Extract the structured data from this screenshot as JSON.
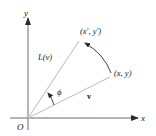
{
  "diagram": {
    "axes": {
      "x_label": "x",
      "y_label": "y",
      "origin_label": "O"
    },
    "vectors": {
      "original": {
        "label": "v",
        "endpoint_label": "(x, y)"
      },
      "rotated": {
        "label": "L(v)",
        "endpoint_label": "(x′, y′)"
      }
    },
    "angle_label": "ϕ",
    "colors": {
      "axis": "#6a6a6a",
      "vector": "#c8c8c8",
      "arrow": "#2a2a2a",
      "text": "#222222"
    }
  }
}
